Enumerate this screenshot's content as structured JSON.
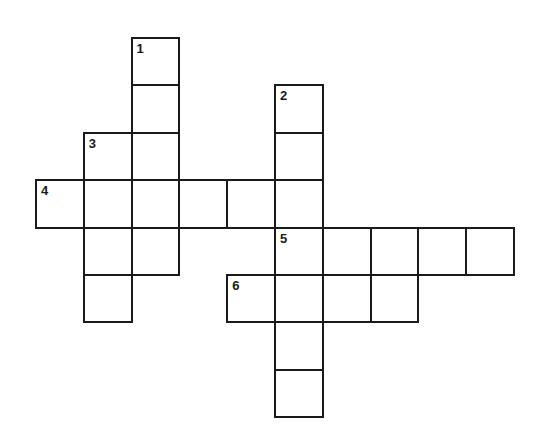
{
  "puzzle": {
    "type": "crossword",
    "grid": {
      "origin_x": 36,
      "origin_y": 38,
      "cell_w": 47.8,
      "cell_h": 47.4,
      "columns": 10,
      "rows": 8
    },
    "cells": [
      {
        "row": 0,
        "col": 2,
        "number": "1",
        "letter": ""
      },
      {
        "row": 1,
        "col": 2,
        "number": "",
        "letter": ""
      },
      {
        "row": 1,
        "col": 5,
        "number": "2",
        "letter": ""
      },
      {
        "row": 2,
        "col": 1,
        "number": "3",
        "letter": ""
      },
      {
        "row": 2,
        "col": 2,
        "number": "",
        "letter": ""
      },
      {
        "row": 2,
        "col": 5,
        "number": "",
        "letter": ""
      },
      {
        "row": 3,
        "col": 0,
        "number": "4",
        "letter": ""
      },
      {
        "row": 3,
        "col": 1,
        "number": "",
        "letter": ""
      },
      {
        "row": 3,
        "col": 2,
        "number": "",
        "letter": ""
      },
      {
        "row": 3,
        "col": 3,
        "number": "",
        "letter": ""
      },
      {
        "row": 3,
        "col": 4,
        "number": "",
        "letter": ""
      },
      {
        "row": 3,
        "col": 5,
        "number": "",
        "letter": ""
      },
      {
        "row": 4,
        "col": 1,
        "number": "",
        "letter": ""
      },
      {
        "row": 4,
        "col": 2,
        "number": "",
        "letter": ""
      },
      {
        "row": 4,
        "col": 5,
        "number": "5",
        "letter": ""
      },
      {
        "row": 4,
        "col": 6,
        "number": "",
        "letter": ""
      },
      {
        "row": 4,
        "col": 7,
        "number": "",
        "letter": ""
      },
      {
        "row": 4,
        "col": 8,
        "number": "",
        "letter": ""
      },
      {
        "row": 4,
        "col": 9,
        "number": "",
        "letter": ""
      },
      {
        "row": 5,
        "col": 1,
        "number": "",
        "letter": ""
      },
      {
        "row": 5,
        "col": 4,
        "number": "6",
        "letter": ""
      },
      {
        "row": 5,
        "col": 5,
        "number": "",
        "letter": ""
      },
      {
        "row": 5,
        "col": 6,
        "number": "",
        "letter": ""
      },
      {
        "row": 5,
        "col": 7,
        "number": "",
        "letter": ""
      },
      {
        "row": 6,
        "col": 5,
        "number": "",
        "letter": ""
      },
      {
        "row": 7,
        "col": 5,
        "number": "",
        "letter": ""
      }
    ],
    "words": [
      {
        "number": "1",
        "direction": "down",
        "start_row": 0,
        "start_col": 2,
        "length": 5
      },
      {
        "number": "2",
        "direction": "down",
        "start_row": 1,
        "start_col": 5,
        "length": 7
      },
      {
        "number": "3",
        "direction": "down",
        "start_row": 2,
        "start_col": 1,
        "length": 4
      },
      {
        "number": "4",
        "direction": "across",
        "start_row": 3,
        "start_col": 0,
        "length": 6
      },
      {
        "number": "5",
        "direction": "across",
        "start_row": 4,
        "start_col": 5,
        "length": 5
      },
      {
        "number": "6",
        "direction": "across",
        "start_row": 5,
        "start_col": 4,
        "length": 4
      }
    ],
    "colors": {
      "line": "#1a1a1a",
      "background": "#ffffff"
    }
  }
}
